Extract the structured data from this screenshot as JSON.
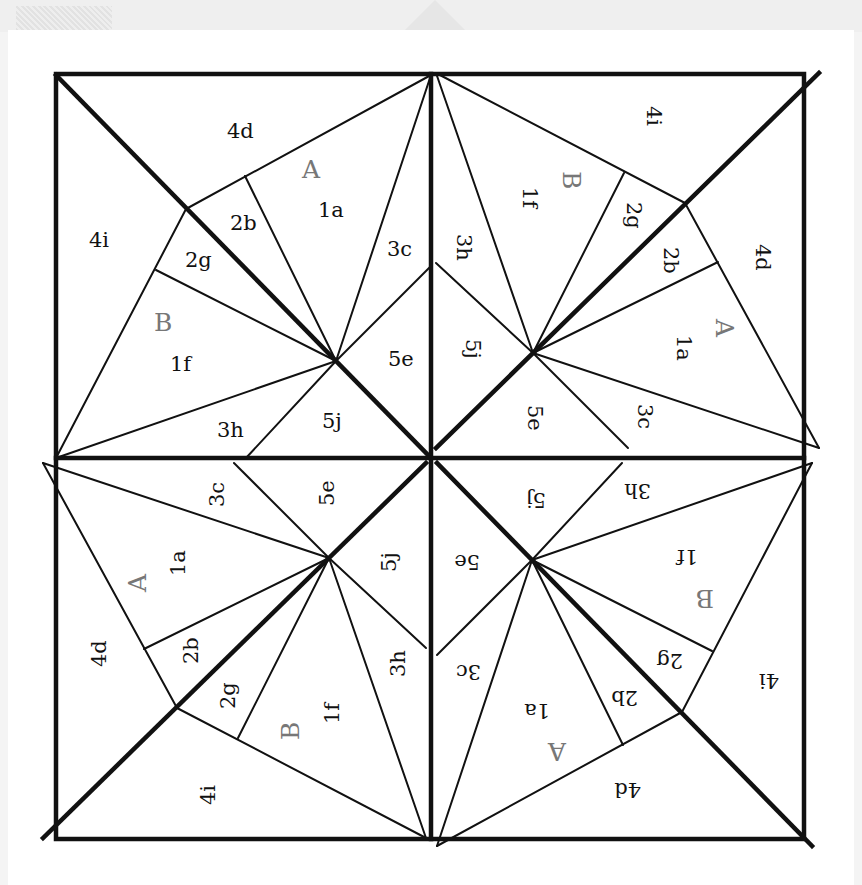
{
  "diagram": {
    "colors": {
      "line": "#111111",
      "label": "#111111",
      "section_letter": "#777777",
      "paper": "#ffffff"
    },
    "quadrants": [
      {
        "id": "top-left",
        "rotation": 0,
        "labels": {
          "4d": "4d",
          "4i": "4i",
          "A": "A",
          "1a": "1a",
          "2b": "2b",
          "2g": "2g",
          "3c": "3c",
          "B": "B",
          "1f": "1f",
          "5e": "5e",
          "3h": "3h",
          "5j": "5j"
        }
      },
      {
        "id": "top-right",
        "rotation": 90,
        "labels": {
          "4d": "4d",
          "4i": "4i",
          "A": "A",
          "1a": "1a",
          "2b": "2b",
          "2g": "2g",
          "3c": "3c",
          "B": "B",
          "1f": "1f",
          "5e": "5e",
          "3h": "3h",
          "5j": "5j"
        }
      },
      {
        "id": "bottom-right",
        "rotation": 180,
        "labels": {
          "4d": "4d",
          "4i": "4i",
          "A": "A",
          "1a": "1a",
          "2b": "2b",
          "2g": "2g",
          "3c": "3c",
          "B": "B",
          "1f": "1f",
          "5e": "5e",
          "3h": "3h",
          "5j": "5j"
        }
      },
      {
        "id": "bottom-left",
        "rotation": 270,
        "labels": {
          "4d": "4d",
          "4i": "4i",
          "A": "A",
          "1a": "1a",
          "2b": "2b",
          "2g": "2g",
          "3c": "3c",
          "B": "B",
          "1f": "1f",
          "5e": "5e",
          "3h": "3h",
          "5j": "5j"
        }
      }
    ]
  }
}
